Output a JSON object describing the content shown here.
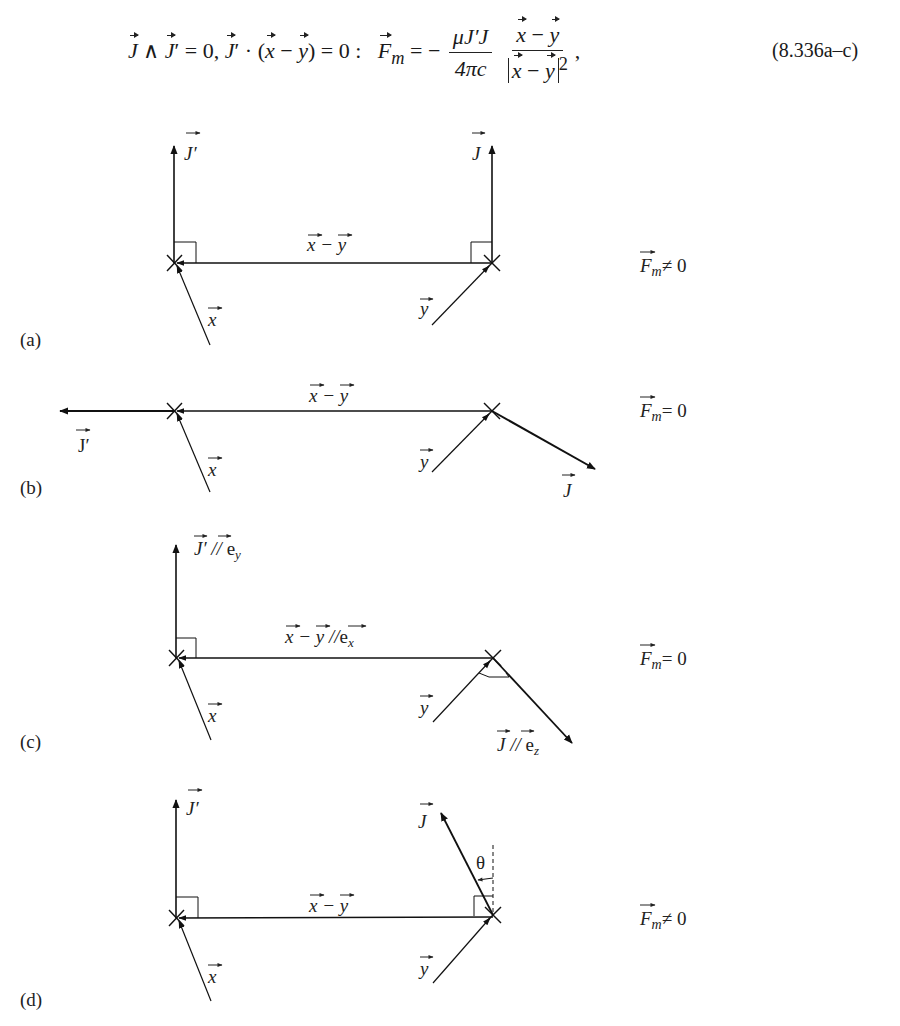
{
  "equation": {
    "lhs_condition": "J ∧ J′ = 0, J′ · (x − y) = 0 :",
    "force_symbol": "F",
    "force_subscript": "m",
    "sign": "= −",
    "coef_numerator": "μJ′J",
    "coef_denominator": "4πc",
    "vec_numerator": "x − y",
    "vec_denominator": "|x − y|²",
    "trailing": ",",
    "number": "(8.336a–c)"
  },
  "figure": {
    "panels": [
      {
        "id": "a",
        "label": "(a)",
        "label_pos": [
          20,
          340
        ],
        "result": "F_m ≠ 0",
        "result_text": "≠ 0",
        "result_pos": [
          640,
          270
        ],
        "left_point": [
          175,
          263
        ],
        "right_point": [
          492,
          263
        ],
        "xmy_label": "x − y",
        "xmy_label_pos": [
          307,
          250
        ],
        "x_label_pos": [
          208,
          328
        ],
        "y_label_pos": [
          420,
          312
        ]
      },
      {
        "id": "b",
        "label": "(b)",
        "label_pos": [
          20,
          488
        ],
        "result": "F_m = 0",
        "result_text": "= 0",
        "result_pos": [
          640,
          416
        ],
        "left_point": [
          175,
          411
        ],
        "right_point": [
          492,
          411
        ],
        "xmy_label": "x − y",
        "xmy_label_pos": [
          307,
          400
        ],
        "x_label_pos": [
          208,
          474
        ],
        "y_label_pos": [
          420,
          466
        ],
        "J_prime_label": "J′",
        "J_prime_label_pos": [
          76,
          454
        ],
        "J_label": "J",
        "J_label_pos": [
          563,
          492
        ]
      },
      {
        "id": "c",
        "label": "(c)",
        "label_pos": [
          20,
          742
        ],
        "result": "F_m = 0",
        "result_text": "= 0",
        "result_pos": [
          640,
          664
        ],
        "left_point": [
          176,
          658
        ],
        "right_point": [
          493,
          658
        ],
        "xmy_label": "x − y //e_x",
        "xmy_label_pos": [
          286,
          642
        ],
        "x_label_pos": [
          208,
          721
        ],
        "y_label_pos": [
          420,
          713
        ],
        "J_prime_label": "J′ // e_y",
        "J_prime_label_pos": [
          194,
          552
        ],
        "J_label": "J // e_z",
        "J_label_pos": [
          498,
          752
        ]
      },
      {
        "id": "d",
        "label": "(d)",
        "label_pos": [
          20,
          1000
        ],
        "result": "F_m ≠ 0",
        "result_text": "≠ 0",
        "result_pos": [
          640,
          925
        ],
        "left_point": [
          176,
          918
        ],
        "right_point": [
          493,
          915
        ],
        "xmy_label": "x − y",
        "xmy_label_pos": [
          307,
          904
        ],
        "x_label_pos": [
          208,
          982
        ],
        "y_label_pos": [
          420,
          975
        ],
        "J_prime_label": "J′",
        "J_prime_label_pos": [
          186,
          822
        ],
        "J_label": "J",
        "J_label_pos": [
          416,
          828
        ],
        "theta_label": "θ",
        "theta_label_pos": [
          476,
          868
        ]
      }
    ],
    "symbols": {
      "J": "J",
      "J_prime": "J′",
      "x": "x",
      "y": "y",
      "F": "F",
      "m": "m"
    }
  }
}
